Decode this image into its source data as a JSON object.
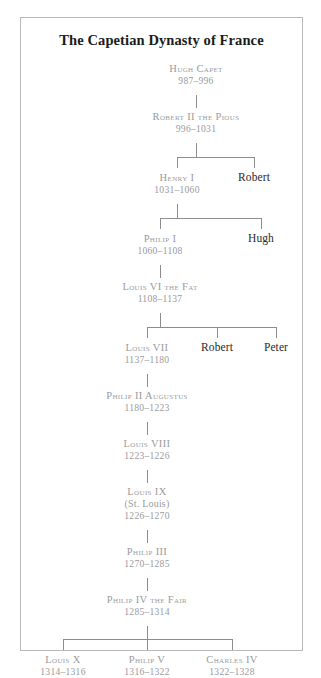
{
  "chart": {
    "title": "The Capetian Dynasty of France",
    "colors": {
      "king_text": "#9a9a9e",
      "sibling_text": "#2a2a2a",
      "title_text": "#1b1b1b",
      "line": "#8d8d8d",
      "border": "#b9b9b9",
      "background": "#ffffff"
    },
    "nodes": [
      {
        "id": "hugh-capet",
        "name": "Hugh Capet",
        "dates": "987–996",
        "kind": "king"
      },
      {
        "id": "robert-ii",
        "name": "Robert II the Pious",
        "dates": "996–1031",
        "kind": "king"
      },
      {
        "id": "henry-i",
        "name": "Henry I",
        "dates": "1031–1060",
        "kind": "king"
      },
      {
        "id": "robert-b-henry",
        "name": "Robert",
        "dates": "",
        "kind": "sibling"
      },
      {
        "id": "philip-i",
        "name": "Philip I",
        "dates": "1060–1108",
        "kind": "king"
      },
      {
        "id": "hugh",
        "name": "Hugh",
        "dates": "",
        "kind": "sibling"
      },
      {
        "id": "louis-vi",
        "name": "Louis VI the Fat",
        "dates": "1108–1137",
        "kind": "king"
      },
      {
        "id": "louis-vii",
        "name": "Louis VII",
        "dates": "1137–1180",
        "kind": "king"
      },
      {
        "id": "robert-b-louisvii",
        "name": "Robert",
        "dates": "",
        "kind": "sibling"
      },
      {
        "id": "peter",
        "name": "Peter",
        "dates": "",
        "kind": "sibling"
      },
      {
        "id": "philip-ii",
        "name": "Philip II Augustus",
        "dates": "1180–1223",
        "kind": "king"
      },
      {
        "id": "louis-viii",
        "name": "Louis VIII",
        "dates": "1223–1226",
        "kind": "king"
      },
      {
        "id": "louis-ix",
        "name": "Louis IX",
        "sub": "(St. Louis)",
        "dates": "1226–1270",
        "kind": "king"
      },
      {
        "id": "philip-iii",
        "name": "Philip III",
        "dates": "1270–1285",
        "kind": "king"
      },
      {
        "id": "philip-iv",
        "name": "Philip IV the Fair",
        "dates": "1285–1314",
        "kind": "king"
      },
      {
        "id": "louis-x",
        "name": "Louis X",
        "dates": "1314–1316",
        "kind": "king"
      },
      {
        "id": "philip-v",
        "name": "Philip V",
        "dates": "1316–1322",
        "kind": "king"
      },
      {
        "id": "charles-iv",
        "name": "Charles IV",
        "dates": "1322–1328",
        "kind": "king"
      }
    ]
  }
}
